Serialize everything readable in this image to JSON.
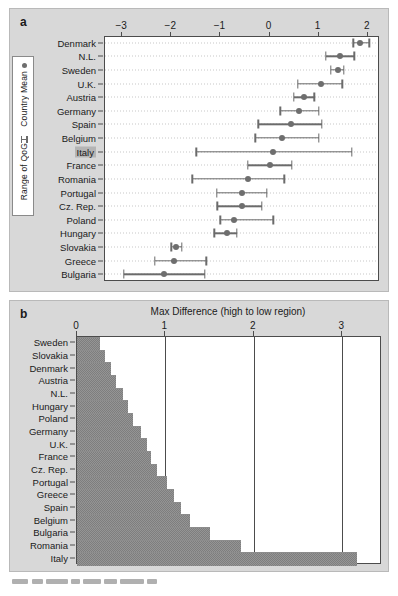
{
  "figure": {
    "panel_a_letter": "a",
    "panel_b_letter": "b"
  },
  "chart_data": [
    {
      "type": "scatter",
      "panel": "a",
      "title": "",
      "xlabel": "",
      "ylabel": "",
      "xlim": [
        -3.35,
        2.25
      ],
      "xticks": [
        -3,
        -2,
        -1,
        0,
        1,
        2
      ],
      "xticklabels": [
        "−3",
        "−2",
        "−1",
        "0",
        "1",
        "2"
      ],
      "grid": "dotted-horizontal",
      "legend": {
        "position": "left-outside",
        "entries": [
          {
            "label": "Country Mean",
            "marker": "dot"
          },
          {
            "label": "Range of QoG",
            "marker": "range-bar"
          }
        ]
      },
      "highlighted_category": "Italy",
      "categories": [
        "Denmark",
        "N.L.",
        "Sweden",
        "U.K.",
        "Austria",
        "Germany",
        "Spain",
        "Belgium",
        "Italy",
        "France",
        "Romania",
        "Portugal",
        "Cz. Rep.",
        "Poland",
        "Hungary",
        "Slovakia",
        "Greece",
        "Bulgaria"
      ],
      "points": [
        {
          "country": "Denmark",
          "mean": 1.86,
          "low": 1.73,
          "high": 2.05
        },
        {
          "country": "N.L.",
          "mean": 1.45,
          "low": 1.17,
          "high": 1.75
        },
        {
          "country": "Sweden",
          "mean": 1.41,
          "low": 1.27,
          "high": 1.53
        },
        {
          "country": "U.K.",
          "mean": 1.07,
          "low": 0.6,
          "high": 1.5
        },
        {
          "country": "Austria",
          "mean": 0.73,
          "low": 0.52,
          "high": 0.93
        },
        {
          "country": "Germany",
          "mean": 0.62,
          "low": 0.24,
          "high": 1.02
        },
        {
          "country": "Spain",
          "mean": 0.45,
          "low": -0.21,
          "high": 1.08
        },
        {
          "country": "Belgium",
          "mean": 0.28,
          "low": -0.27,
          "high": 1.03
        },
        {
          "country": "Italy",
          "mean": 0.1,
          "low": -1.47,
          "high": 1.7
        },
        {
          "country": "France",
          "mean": 0.03,
          "low": -0.42,
          "high": 0.47
        },
        {
          "country": "Romania",
          "mean": -0.42,
          "low": -1.55,
          "high": 0.32
        },
        {
          "country": "Portugal",
          "mean": -0.55,
          "low": -1.05,
          "high": -0.03
        },
        {
          "country": "Cz. Rep.",
          "mean": -0.55,
          "low": -1.04,
          "high": -0.14
        },
        {
          "country": "Poland",
          "mean": -0.7,
          "low": -0.98,
          "high": 0.1
        },
        {
          "country": "Hungary",
          "mean": -0.85,
          "low": -1.1,
          "high": -0.64
        },
        {
          "country": "Slovakia",
          "mean": -1.88,
          "low": -1.98,
          "high": -1.76
        },
        {
          "country": "Greece",
          "mean": -1.93,
          "low": -2.32,
          "high": -1.27
        },
        {
          "country": "Bulgaria",
          "mean": -2.13,
          "low": -2.95,
          "high": -1.3
        }
      ]
    },
    {
      "type": "bar",
      "panel": "b",
      "orientation": "horizontal",
      "title": "Max Difference (high to low region)",
      "xlabel": "",
      "ylabel": "",
      "xlim": [
        0,
        3.45
      ],
      "xticks": [
        0,
        1,
        2,
        3
      ],
      "xticklabels": [
        "0",
        "1",
        "2",
        "3"
      ],
      "grid": "vertical-lines",
      "categories": [
        "Sweden",
        "Slovakia",
        "Denmark",
        "Austria",
        "N.L.",
        "Hungary",
        "Poland",
        "Germany",
        "U.K.",
        "France",
        "Cz. Rep.",
        "Portugal",
        "Greece",
        "Spain",
        "Belgium",
        "Bulgaria",
        "Romania",
        "Italy"
      ],
      "values": [
        0.26,
        0.32,
        0.38,
        0.44,
        0.52,
        0.58,
        0.63,
        0.72,
        0.79,
        0.84,
        0.9,
        1.02,
        1.1,
        1.18,
        1.28,
        1.5,
        1.85,
        3.17
      ]
    }
  ]
}
